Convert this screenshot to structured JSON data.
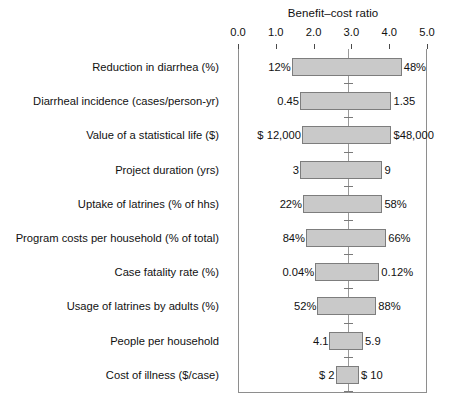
{
  "chart_data": {
    "type": "bar",
    "subtype": "tornado",
    "title": "Benefit–cost ratio",
    "xlabel": "Benefit–cost ratio",
    "ylabel": "",
    "xlim": [
      0.0,
      5.0
    ],
    "xticks": [
      "0.0",
      "1.0",
      "2.0",
      "3.0",
      "4.0",
      "5.0"
    ],
    "xtick_values": [
      0.0,
      1.0,
      2.0,
      3.0,
      4.0,
      5.0
    ],
    "grid": false,
    "legend": false,
    "baseline": 2.9,
    "categories": [
      "Reduction in diarrhea (%)",
      "Diarrheal incidence (cases/person-yr)",
      "Value of a statistical life ($)",
      "Project duration (yrs)",
      "Uptake of latrines (% of hhs)",
      "Program costs per household (% of total)",
      "Case fatality rate (%)",
      "Usage of latrines by adults (%)",
      "People per household",
      "Cost of illness ($/case)"
    ],
    "bars": [
      {
        "label": "Reduction in diarrhea (%)",
        "low": 1.42,
        "high": 4.33,
        "low_text": "12%",
        "high_text": "48%"
      },
      {
        "label": "Diarrheal incidence (cases/person-yr)",
        "low": 1.64,
        "high": 4.06,
        "low_text": "0.45",
        "high_text": "1.35"
      },
      {
        "label": "Value of a statistical life ($)",
        "low": 1.69,
        "high": 4.06,
        "low_text": "$ 12,000",
        "high_text": "$48,000"
      },
      {
        "label": "Project duration (yrs)",
        "low": 1.64,
        "high": 3.82,
        "low_text": "3",
        "high_text": "9"
      },
      {
        "label": "Uptake of latrines (% of hhs)",
        "low": 1.72,
        "high": 3.82,
        "low_text": "22%",
        "high_text": "58%"
      },
      {
        "label": "Program costs per household (% of total)",
        "low": 1.8,
        "high": 3.92,
        "low_text": "84%",
        "high_text": "66%"
      },
      {
        "label": "Case fatality rate (%)",
        "low": 2.04,
        "high": 3.74,
        "low_text": "0.04%",
        "high_text": "0.12%"
      },
      {
        "label": "Usage of latrines by adults (%)",
        "low": 2.1,
        "high": 3.66,
        "low_text": "52%",
        "high_text": "88%"
      },
      {
        "label": "People per household",
        "low": 2.42,
        "high": 3.31,
        "low_text": "4.1",
        "high_text": "5.9"
      },
      {
        "label": "Cost of illness ($/case)",
        "low": 2.58,
        "high": 3.2,
        "low_text": "$      2",
        "high_text": "$    10"
      }
    ],
    "colors": {
      "bar_fill": "#c9c9c9",
      "bar_stroke": "#7d7d7d",
      "frame": "#8e8e8e",
      "baseline": "#9a9a9a",
      "text": "#111111",
      "background": "#ffffff"
    }
  }
}
